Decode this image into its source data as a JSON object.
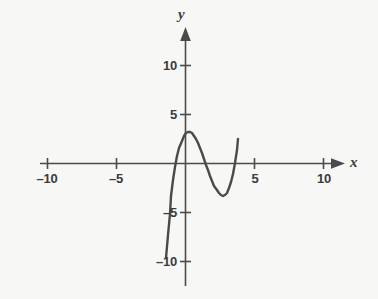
{
  "figure": {
    "background_color": "#f7f7f5",
    "ink_color": "#4a4a4a",
    "text_color": "#3b3b3b"
  },
  "axes": {
    "x_axis_label": "x",
    "y_axis_label": "y",
    "x_ticks": [
      {
        "value": -10,
        "label": "–10"
      },
      {
        "value": -5,
        "label": "–5"
      },
      {
        "value": 5,
        "label": "5"
      },
      {
        "value": 10,
        "label": "10"
      }
    ],
    "y_ticks": [
      {
        "value": 10,
        "label": "10"
      },
      {
        "value": 5,
        "label": "5"
      },
      {
        "value": -5,
        "label": "–5"
      },
      {
        "value": -10,
        "label": "–10"
      }
    ]
  },
  "chart_data": {
    "type": "line",
    "title": "",
    "xlabel": "x",
    "ylabel": "y",
    "xlim": [
      -11,
      11
    ],
    "ylim": [
      -11,
      11
    ],
    "grid": false,
    "legend": "none",
    "curve_name": "cubic-polynomial",
    "equation": "y = 1.4(x + 0.8)(x - 1.2)(x - 3.4)",
    "roots": [
      -0.8,
      1.2,
      3.4
    ],
    "local_maximum": {
      "x": 0.0,
      "y": 3.3
    },
    "local_minimum": {
      "x": 2.4,
      "y": -3.0
    },
    "y_intercept": 3.3,
    "domain_drawn": [
      -1.45,
      3.9
    ],
    "endpoints": [
      {
        "x": -1.45,
        "y": -9.7
      },
      {
        "x": 3.9,
        "y": 10.0
      }
    ],
    "x": [
      -1.45,
      -1.3,
      -1.15,
      -1.0,
      -0.85,
      -0.7,
      -0.55,
      -0.4,
      -0.25,
      -0.1,
      0.05,
      0.2,
      0.35,
      0.5,
      0.65,
      0.8,
      0.95,
      1.1,
      1.25,
      1.4,
      1.55,
      1.7,
      1.85,
      2.0,
      2.15,
      2.3,
      2.45,
      2.6,
      2.75,
      2.9,
      3.05,
      3.2,
      3.35,
      3.5,
      3.65,
      3.8,
      3.9
    ],
    "y": [
      -9.69,
      -7.29,
      -5.17,
      -3.33,
      -1.75,
      -0.42,
      0.67,
      1.54,
      2.21,
      2.69,
      3.0,
      3.15,
      3.15,
      3.03,
      2.79,
      2.45,
      2.03,
      1.54,
      1.0,
      0.42,
      -0.17,
      -0.76,
      -1.33,
      -1.87,
      -2.35,
      -2.76,
      -3.07,
      -3.27,
      -3.34,
      -3.26,
      -3.01,
      -2.57,
      -1.93,
      -1.07,
      0.02,
      1.35,
      2.42
    ],
    "points_px": [
      [
        166,
        258
      ],
      [
        168,
        235
      ],
      [
        170,
        214
      ],
      [
        171,
        196
      ],
      [
        173,
        180
      ],
      [
        175,
        167
      ],
      [
        177,
        156
      ],
      [
        179,
        148
      ],
      [
        182,
        141
      ],
      [
        184,
        136
      ],
      [
        186,
        133
      ],
      [
        188,
        132
      ],
      [
        190,
        132
      ],
      [
        192,
        133
      ],
      [
        194,
        136
      ],
      [
        196,
        139
      ],
      [
        198,
        143
      ],
      [
        200,
        148
      ],
      [
        202,
        153
      ],
      [
        204,
        159
      ],
      [
        206,
        165
      ],
      [
        208,
        170
      ],
      [
        210,
        176
      ],
      [
        212,
        181
      ],
      [
        214,
        186
      ],
      [
        217,
        190
      ],
      [
        219,
        193
      ],
      [
        221,
        195
      ],
      [
        223,
        196
      ],
      [
        225,
        195
      ],
      [
        227,
        193
      ],
      [
        229,
        188
      ],
      [
        231,
        182
      ],
      [
        233,
        174
      ],
      [
        235,
        163
      ],
      [
        237,
        150
      ],
      [
        238,
        139
      ]
    ]
  }
}
